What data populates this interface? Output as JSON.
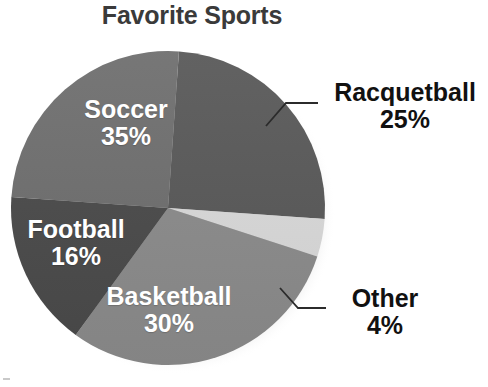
{
  "chart_data": {
    "type": "pie",
    "title": "Favorite Sports",
    "xlabel": "",
    "ylabel": "",
    "legend_position": "none",
    "grid": false,
    "units": "percent",
    "total": 110,
    "categories": [
      "Racquetball",
      "Other",
      "Basketball",
      "Football",
      "Soccer"
    ],
    "values": [
      25,
      4,
      30,
      16,
      35
    ],
    "slices": [
      {
        "label": "Racquetball",
        "value": 25,
        "value_text": "25%",
        "color": "#585858",
        "label_placement": "outside",
        "leader_line": true,
        "start_angle_deg": 4,
        "end_angle_deg": 94
      },
      {
        "label": "Other",
        "value": 4,
        "value_text": "4%",
        "color": "#d9d9d9",
        "label_placement": "outside",
        "leader_line": true,
        "start_angle_deg": 94,
        "end_angle_deg": 108
      },
      {
        "label": "Basketball",
        "value": 30,
        "value_text": "30%",
        "color": "#8b8b8b",
        "label_placement": "inside",
        "leader_line": false,
        "start_angle_deg": 108,
        "end_angle_deg": 216
      },
      {
        "label": "Football",
        "value": 16,
        "value_text": "16%",
        "color": "#4a4a4a",
        "label_placement": "inside",
        "leader_line": false,
        "start_angle_deg": 216,
        "end_angle_deg": 274
      },
      {
        "label": "Soccer",
        "value": 35,
        "value_text": "35%",
        "color": "#6e6e6e",
        "label_placement": "inside",
        "leader_line": false,
        "start_angle_deg": 274,
        "end_angle_deg": 364
      }
    ],
    "geometry": {
      "center_x": 168,
      "center_y": 208,
      "radius": 157
    },
    "colors": {
      "title": "#3a3a3a",
      "inside_label": "#ffffff",
      "outside_label": "#111111",
      "leader_line": "#2b2b2b",
      "background": "#ffffff",
      "shadow": "#bdbdbd"
    }
  }
}
